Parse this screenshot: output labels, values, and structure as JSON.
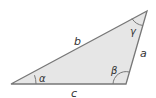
{
  "diagram": {
    "type": "triangle",
    "fill": "#e6e6e6",
    "stroke": "#777777",
    "vertices": {
      "A": [
        11,
        84
      ],
      "B": [
        126,
        84
      ],
      "C": [
        147,
        11
      ]
    },
    "sides": {
      "a": "a",
      "b": "b",
      "c": "c"
    },
    "angles": {
      "alpha": "α",
      "beta": "β",
      "gamma": "γ"
    }
  }
}
